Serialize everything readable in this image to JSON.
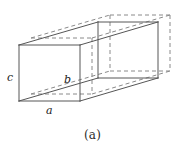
{
  "figure": {
    "caption": "(a)",
    "labels": {
      "height_label": "c",
      "depth_label": "b",
      "width_label": "a"
    },
    "colors": {
      "solid_stroke": "#555555",
      "dashed_stroke": "#8a8a8a",
      "background": "#ffffff",
      "text": "#1a1a1a"
    },
    "geometry": {
      "solid_front_face": {
        "top_left": [
          19,
          45
        ],
        "top_right": [
          80,
          45
        ],
        "bottom_right": [
          80,
          101
        ],
        "bottom_left": [
          19,
          101
        ]
      },
      "solid_back_face": {
        "top_left": [
          98,
          22
        ],
        "top_right": [
          158,
          22
        ],
        "bottom_right": [
          158,
          78
        ],
        "bottom_left": [
          98,
          78
        ]
      },
      "dashed_front_face": {
        "top_left": [
          31,
          38
        ],
        "top_right": [
          92,
          38
        ],
        "bottom_right": [
          92,
          94
        ],
        "bottom_left": [
          31,
          94
        ]
      },
      "dashed_back_face": {
        "top_left": [
          110,
          15
        ],
        "top_right": [
          170,
          15
        ],
        "bottom_right": [
          170,
          71
        ],
        "bottom_left": [
          110,
          71
        ]
      },
      "offset_vector": [
        12,
        -7
      ],
      "depth_vector": [
        79,
        -23
      ]
    },
    "edges": {
      "height_edge": "left vertical front edge (c)",
      "depth_edge": "diagonal from front-bottom-left to back-bottom-right (b)",
      "width_edge": "bottom horizontal front edge (a)"
    }
  }
}
